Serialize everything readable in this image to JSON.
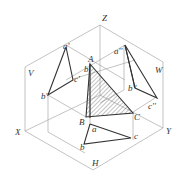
{
  "figure": {
    "type": "orthographic projection diagram",
    "axes": {
      "x": "X",
      "y": "Y",
      "z": "Z"
    },
    "planes": {
      "v": "V",
      "w": "W",
      "h": "H"
    },
    "space_points": {
      "a": "A",
      "b": "B",
      "c": "C"
    },
    "v_projections": {
      "a": "a'",
      "b": "b'",
      "c": "c'"
    },
    "w_projections": {
      "a": "a''",
      "b": "b''",
      "c": "c''"
    },
    "h_projections": {
      "a": "a",
      "b": "b",
      "c": "c"
    },
    "extra": {
      "b_near_a": "b"
    },
    "colors": {
      "line": "#333333",
      "guide": "#9a9a9a",
      "hatch": "#555555"
    }
  }
}
